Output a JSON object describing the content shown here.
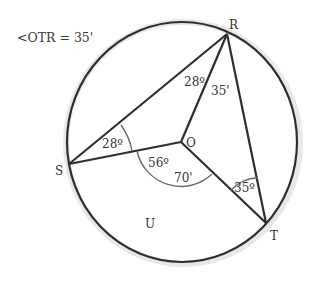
{
  "diagram": {
    "given": "<OTR = 35'",
    "points": {
      "R": "R",
      "S": "S",
      "T": "T",
      "O": "O",
      "U": "U"
    },
    "angles": {
      "ORS_at_R": "28º",
      "ORT_at_R": "35'",
      "OSR_at_S": "28º",
      "SOU_arc": "56º",
      "UOT_arc": "70'",
      "OTR_at_T": "35º"
    },
    "colors": {
      "stroke": "#2e2e2e",
      "arc": "#6a6a6a",
      "text": "#333333",
      "background": "#ffffff"
    }
  }
}
